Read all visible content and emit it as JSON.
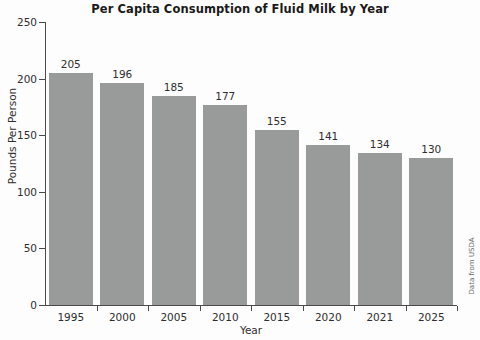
{
  "chart_data": {
    "type": "bar",
    "title": "Per Capita Consumption of Fluid Milk by Year",
    "xlabel": "Year",
    "ylabel": "Pounds Per Person",
    "categories": [
      "1995",
      "2000",
      "2005",
      "2010",
      "2015",
      "2020",
      "2021",
      "2025"
    ],
    "values": [
      205,
      196,
      185,
      177,
      155,
      141,
      134,
      130
    ],
    "value_labels": [
      "205",
      "196",
      "185",
      "177",
      "155",
      "141",
      "134",
      "130"
    ],
    "ylim": [
      0,
      250
    ],
    "yticks": [
      0,
      50,
      100,
      150,
      200,
      250
    ],
    "ytick_labels": [
      "0",
      "50",
      "100",
      "150",
      "200",
      "250"
    ],
    "grid": false,
    "legend": false,
    "bar_color": "#999a9a",
    "axis_color": "#4a4a4a",
    "text_color": "#2e2e2e",
    "background_color": "#fdfdfd"
  },
  "source_note": "Data from USDA"
}
